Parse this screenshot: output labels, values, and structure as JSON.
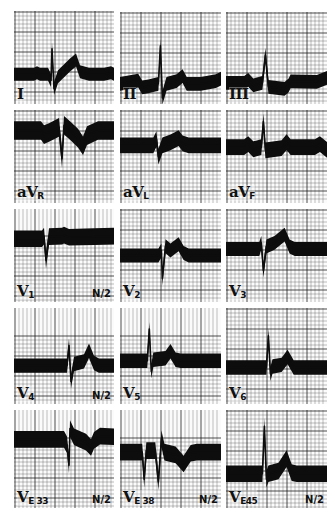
{
  "figure": {
    "colors": {
      "background": "#ffffff",
      "paper": "#fbfbfb",
      "grid": "#1a1a1a",
      "trace": "#0d0d0d",
      "text": "#111111"
    }
  },
  "panels": [
    {
      "id": "I",
      "label_main": "I",
      "label_sub": "",
      "gain": "",
      "x": 14,
      "y": 11,
      "w": 100,
      "h": 93,
      "grid": "full",
      "baseline": 0.68,
      "thickness": 0.14,
      "points": [
        [
          0,
          0
        ],
        [
          0.2,
          0
        ],
        [
          0.23,
          -0.03
        ],
        [
          0.26,
          0
        ],
        [
          0.34,
          0
        ],
        [
          0.37,
          0.12
        ],
        [
          0.38,
          -0.5
        ],
        [
          0.4,
          0.28
        ],
        [
          0.44,
          0.05
        ],
        [
          0.56,
          -0.18
        ],
        [
          0.62,
          -0.28
        ],
        [
          0.66,
          -0.05
        ],
        [
          0.75,
          0
        ],
        [
          0.9,
          0
        ],
        [
          0.97,
          -0.03
        ],
        [
          1,
          0
        ]
      ]
    },
    {
      "id": "II",
      "label_main": "II",
      "label_sub": "",
      "gain": "",
      "x": 120,
      "y": 12,
      "w": 101,
      "h": 92,
      "grid": "full",
      "baseline": 0.78,
      "thickness": 0.15,
      "points": [
        [
          0,
          0
        ],
        [
          0.18,
          -0.06
        ],
        [
          0.22,
          0.07
        ],
        [
          0.28,
          0.05
        ],
        [
          0.38,
          0
        ],
        [
          0.4,
          -0.75
        ],
        [
          0.42,
          0.28
        ],
        [
          0.46,
          0
        ],
        [
          0.56,
          -0.05
        ],
        [
          0.62,
          -0.15
        ],
        [
          0.66,
          0
        ],
        [
          0.8,
          0
        ],
        [
          0.95,
          -0.05
        ],
        [
          1,
          -0.1
        ]
      ]
    },
    {
      "id": "III",
      "label_main": "III",
      "label_sub": "",
      "gain": "",
      "x": 226,
      "y": 12,
      "w": 101,
      "h": 92,
      "grid": "full",
      "baseline": 0.77,
      "thickness": 0.15,
      "points": [
        [
          0,
          0
        ],
        [
          0.18,
          0
        ],
        [
          0.22,
          -0.06
        ],
        [
          0.27,
          0.05
        ],
        [
          0.36,
          0
        ],
        [
          0.39,
          -0.55
        ],
        [
          0.42,
          0.08
        ],
        [
          0.58,
          0.12
        ],
        [
          0.62,
          0.05
        ],
        [
          0.64,
          -0.03
        ],
        [
          0.9,
          -0.02
        ],
        [
          1,
          -0.1
        ]
      ]
    },
    {
      "id": "aVR",
      "label_main": "aV",
      "label_sub": "R",
      "gain": "",
      "x": 14,
      "y": 110,
      "w": 100,
      "h": 93,
      "grid": "full",
      "baseline": 0.22,
      "thickness": 0.2,
      "points": [
        [
          0,
          0
        ],
        [
          0.27,
          0
        ],
        [
          0.3,
          0.08
        ],
        [
          0.35,
          0.04
        ],
        [
          0.45,
          -0.06
        ],
        [
          0.48,
          0.55
        ],
        [
          0.5,
          -0.1
        ],
        [
          0.56,
          0
        ],
        [
          0.64,
          0.15
        ],
        [
          0.69,
          0.3
        ],
        [
          0.73,
          0.1
        ],
        [
          0.84,
          0
        ],
        [
          1,
          0
        ]
      ]
    },
    {
      "id": "aVL",
      "label_main": "aV",
      "label_sub": "L",
      "gain": "",
      "x": 120,
      "y": 110,
      "w": 101,
      "h": 93,
      "grid": "full",
      "baseline": 0.38,
      "thickness": 0.17,
      "points": [
        [
          0,
          0
        ],
        [
          0.33,
          0
        ],
        [
          0.36,
          -0.12
        ],
        [
          0.38,
          0.22
        ],
        [
          0.42,
          0
        ],
        [
          0.5,
          -0.06
        ],
        [
          0.58,
          -0.14
        ],
        [
          0.62,
          -0.04
        ],
        [
          0.68,
          0
        ],
        [
          1,
          0
        ]
      ]
    },
    {
      "id": "aVF",
      "label_main": "aV",
      "label_sub": "F",
      "gain": "",
      "x": 226,
      "y": 110,
      "w": 101,
      "h": 93,
      "grid": "full",
      "baseline": 0.4,
      "thickness": 0.17,
      "points": [
        [
          0,
          0
        ],
        [
          0.18,
          0
        ],
        [
          0.22,
          -0.06
        ],
        [
          0.27,
          0.04
        ],
        [
          0.35,
          0
        ],
        [
          0.37,
          -0.5
        ],
        [
          0.39,
          0.06
        ],
        [
          0.55,
          0.02
        ],
        [
          0.6,
          -0.1
        ],
        [
          0.64,
          0
        ],
        [
          0.88,
          0
        ],
        [
          0.93,
          -0.06
        ],
        [
          1,
          0.05
        ]
      ]
    },
    {
      "id": "V1",
      "label_main": "V",
      "label_sub": "1",
      "gain": "N/2",
      "x": 14,
      "y": 209,
      "w": 100,
      "h": 93,
      "grid": "vertical-top",
      "baseline": 0.32,
      "thickness": 0.18,
      "points": [
        [
          0,
          0
        ],
        [
          0.28,
          0
        ],
        [
          0.3,
          -0.05
        ],
        [
          0.32,
          0.42
        ],
        [
          0.35,
          -0.04
        ],
        [
          0.48,
          -0.05
        ],
        [
          0.5,
          -0.07
        ],
        [
          0.55,
          -0.03
        ],
        [
          0.8,
          -0.04
        ],
        [
          1,
          -0.05
        ]
      ]
    },
    {
      "id": "V2",
      "label_main": "V",
      "label_sub": "2",
      "gain": "",
      "x": 120,
      "y": 209,
      "w": 101,
      "h": 93,
      "grid": "full",
      "baseline": 0.5,
      "thickness": 0.15,
      "points": [
        [
          0,
          0
        ],
        [
          0.38,
          0
        ],
        [
          0.41,
          -0.1
        ],
        [
          0.42,
          0.45
        ],
        [
          0.45,
          -0.18
        ],
        [
          0.5,
          -0.1
        ],
        [
          0.58,
          -0.22
        ],
        [
          0.63,
          -0.05
        ],
        [
          0.68,
          0
        ],
        [
          1,
          0
        ]
      ]
    },
    {
      "id": "V3",
      "label_main": "V",
      "label_sub": "3",
      "gain": "",
      "x": 226,
      "y": 209,
      "w": 101,
      "h": 93,
      "grid": "full",
      "baseline": 0.43,
      "thickness": 0.15,
      "points": [
        [
          0,
          0
        ],
        [
          0.33,
          0
        ],
        [
          0.35,
          -0.12
        ],
        [
          0.37,
          0.42
        ],
        [
          0.4,
          -0.05
        ],
        [
          0.48,
          -0.12
        ],
        [
          0.58,
          -0.28
        ],
        [
          0.63,
          -0.05
        ],
        [
          0.68,
          0
        ],
        [
          1,
          0
        ]
      ]
    },
    {
      "id": "V4",
      "label_main": "V",
      "label_sub": "4",
      "gain": "N/2",
      "x": 14,
      "y": 308,
      "w": 100,
      "h": 96,
      "grid": "vertical-top",
      "baseline": 0.6,
      "thickness": 0.15,
      "points": [
        [
          0,
          0
        ],
        [
          0.53,
          0
        ],
        [
          0.55,
          -0.38
        ],
        [
          0.57,
          0.3
        ],
        [
          0.6,
          -0.03
        ],
        [
          0.7,
          -0.08
        ],
        [
          0.75,
          -0.28
        ],
        [
          0.8,
          -0.05
        ],
        [
          0.85,
          0
        ],
        [
          1,
          0
        ]
      ]
    },
    {
      "id": "V5",
      "label_main": "V",
      "label_sub": "5",
      "gain": "",
      "x": 120,
      "y": 308,
      "w": 101,
      "h": 96,
      "grid": "vertical-top",
      "baseline": 0.55,
      "thickness": 0.15,
      "points": [
        [
          0,
          0
        ],
        [
          0.27,
          0
        ],
        [
          0.29,
          -0.6
        ],
        [
          0.31,
          0.2
        ],
        [
          0.33,
          -0.02
        ],
        [
          0.45,
          -0.05
        ],
        [
          0.5,
          -0.18
        ],
        [
          0.55,
          -0.02
        ],
        [
          0.6,
          0
        ],
        [
          1,
          0
        ]
      ]
    },
    {
      "id": "V6",
      "label_main": "V",
      "label_sub": "6",
      "gain": "",
      "x": 226,
      "y": 308,
      "w": 101,
      "h": 96,
      "grid": "full",
      "baseline": 0.62,
      "thickness": 0.15,
      "points": [
        [
          0,
          0
        ],
        [
          0.4,
          0
        ],
        [
          0.42,
          -0.6
        ],
        [
          0.44,
          0.12
        ],
        [
          0.46,
          -0.02
        ],
        [
          0.55,
          -0.05
        ],
        [
          0.61,
          -0.2
        ],
        [
          0.67,
          0
        ],
        [
          1,
          0
        ]
      ]
    },
    {
      "id": "VE33",
      "label_main": "V",
      "label_sub": "E 33",
      "gain": "N/2",
      "x": 14,
      "y": 410,
      "w": 100,
      "h": 98,
      "grid": "vertical-top",
      "baseline": 0.3,
      "thickness": 0.17,
      "points": [
        [
          0,
          0
        ],
        [
          0.5,
          0
        ],
        [
          0.53,
          0.1
        ],
        [
          0.55,
          0.48
        ],
        [
          0.56,
          -0.2
        ],
        [
          0.6,
          -0.05
        ],
        [
          0.72,
          0.05
        ],
        [
          0.77,
          0.15
        ],
        [
          0.8,
          0.02
        ],
        [
          0.86,
          -0.06
        ],
        [
          1,
          -0.05
        ]
      ]
    },
    {
      "id": "VE38",
      "label_main": "V",
      "label_sub": "E 38",
      "gain": "N/2",
      "x": 120,
      "y": 410,
      "w": 101,
      "h": 98,
      "grid": "vertical-top",
      "baseline": 0.43,
      "thickness": 0.17,
      "points": [
        [
          0,
          0
        ],
        [
          0.22,
          0
        ],
        [
          0.24,
          0.5
        ],
        [
          0.26,
          -0.03
        ],
        [
          0.35,
          -0.03
        ],
        [
          0.38,
          0.55
        ],
        [
          0.41,
          -0.25
        ],
        [
          0.44,
          0
        ],
        [
          0.55,
          0.05
        ],
        [
          0.63,
          0.22
        ],
        [
          0.7,
          0.02
        ],
        [
          0.76,
          0
        ],
        [
          1,
          0
        ]
      ]
    },
    {
      "id": "VE45",
      "label_main": "V",
      "label_sub": "E45",
      "gain": "N/2",
      "x": 226,
      "y": 410,
      "w": 101,
      "h": 98,
      "grid": "full",
      "baseline": 0.65,
      "thickness": 0.17,
      "points": [
        [
          0,
          0
        ],
        [
          0.36,
          0
        ],
        [
          0.38,
          -0.88
        ],
        [
          0.4,
          0.1
        ],
        [
          0.42,
          0
        ],
        [
          0.52,
          -0.05
        ],
        [
          0.6,
          -0.28
        ],
        [
          0.65,
          -0.02
        ],
        [
          0.7,
          0
        ],
        [
          1,
          0
        ]
      ]
    }
  ]
}
